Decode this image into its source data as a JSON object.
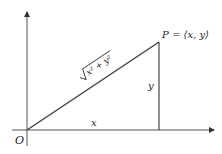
{
  "diagram": {
    "origin_label": "O",
    "point_label": "P = ⟨x, y⟩",
    "point_label_parts": {
      "name": "P",
      "eq": "=",
      "coords": "⟨x, y⟩"
    },
    "hypotenuse_label": "√(x² + y²)",
    "hypotenuse_parts": {
      "radicand": "x² + y²"
    },
    "horizontal_leg_label": "x",
    "vertical_leg_label": "y",
    "colors": {
      "line": "#333333",
      "axis": "#555555",
      "background": "#ffffff"
    }
  }
}
